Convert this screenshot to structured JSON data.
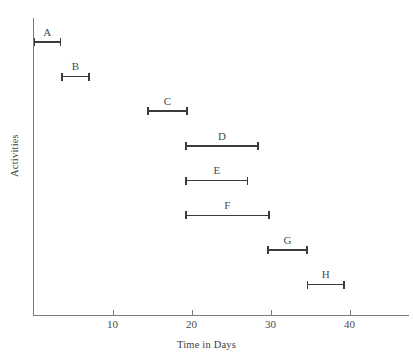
{
  "chart_data": {
    "type": "bar",
    "orientation": "horizontal",
    "title": "",
    "xlabel": "Time in Days",
    "ylabel": "Activities",
    "xlim": [
      0,
      47.5
    ],
    "ylim": [
      0,
      9
    ],
    "grid": false,
    "legend": null,
    "xticks": [
      10,
      20,
      30,
      40
    ],
    "xtick_labels": [
      "10",
      "20",
      "30",
      "40"
    ],
    "ytick_labels": [],
    "categories": [
      "A",
      "B",
      "C",
      "D",
      "E",
      "F",
      "G",
      "H"
    ],
    "series": [
      {
        "name": "Activity duration",
        "type": "range",
        "bars": [
          {
            "label": "A",
            "start": 0.0,
            "end": 3.5,
            "duration": 3.5
          },
          {
            "label": "B",
            "start": 3.5,
            "end": 7.1,
            "duration": 3.6
          },
          {
            "label": "C",
            "start": 14.4,
            "end": 19.5,
            "duration": 5.1
          },
          {
            "label": "D",
            "start": 19.2,
            "end": 28.5,
            "duration": 9.3
          },
          {
            "label": "E",
            "start": 19.2,
            "end": 27.2,
            "duration": 8.0
          },
          {
            "label": "F",
            "start": 19.2,
            "end": 29.9,
            "duration": 10.7
          },
          {
            "label": "G",
            "start": 29.6,
            "end": 34.7,
            "duration": 5.1
          },
          {
            "label": "H",
            "start": 34.6,
            "end": 39.4,
            "duration": 4.8
          }
        ]
      }
    ],
    "colors": {
      "bar": "#3b3b3b",
      "axis": "#7a7a7a",
      "text": "#3c3c3c",
      "background": "#ffffff"
    }
  }
}
